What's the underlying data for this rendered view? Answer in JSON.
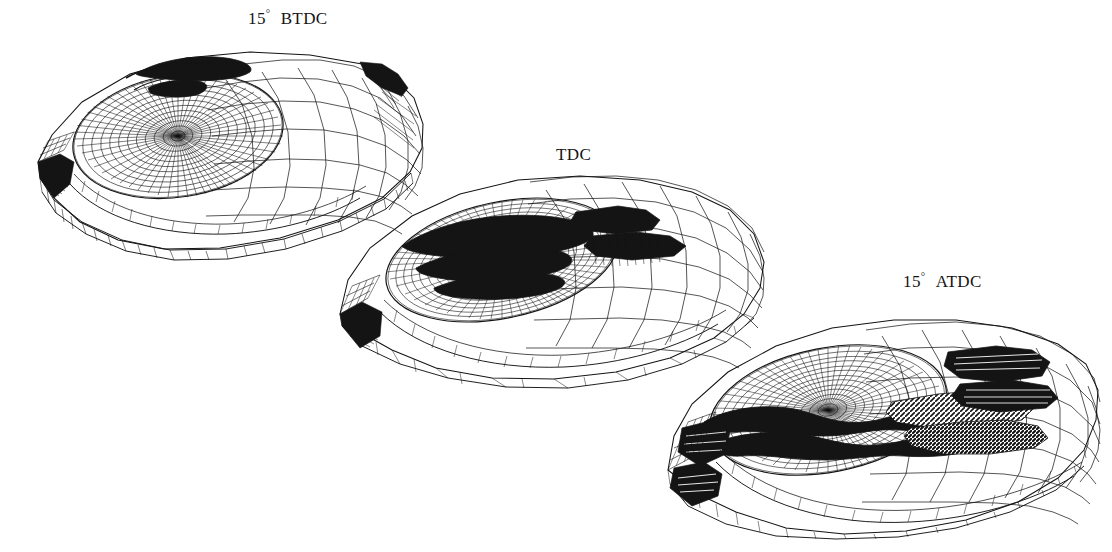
{
  "figure": {
    "background_color": "#ffffff",
    "line_color": "#141414",
    "width": 1112,
    "height": 552
  },
  "views": [
    {
      "id": "btdc",
      "label_angle": "15",
      "label_degree": "°",
      "label_phase": "BTDC",
      "label_full": "15° BTDC",
      "label_x": 248,
      "label_y": 7,
      "mesh_x": 30,
      "mesh_y": 40,
      "mesh_w": 400,
      "mesh_h": 220,
      "description": "piston near bottom, bowl open, coarse squish mesh"
    },
    {
      "id": "tdc",
      "label_angle": "",
      "label_degree": "",
      "label_phase": "TDC",
      "label_full": "TDC",
      "label_x": 551,
      "label_y": 143,
      "mesh_x": 330,
      "mesh_y": 168,
      "mesh_w": 440,
      "mesh_h": 220,
      "description": "piston at top dead centre, mesh highly compressed, dark dense bands"
    },
    {
      "id": "atdc",
      "label_angle": "15",
      "label_degree": "°",
      "label_phase": "ATDC",
      "label_full": "15° ATDC",
      "label_x": 903,
      "label_y": 270,
      "mesh_x": 660,
      "mesh_y": 302,
      "mesh_w": 440,
      "mesh_h": 235,
      "description": "piston descending, bowl re-opening, shaded squish step visible"
    }
  ],
  "colors": {
    "ink": "#141414",
    "paper": "#ffffff",
    "shade_dark": "#1a1a1a",
    "shade_mid": "#555555"
  }
}
